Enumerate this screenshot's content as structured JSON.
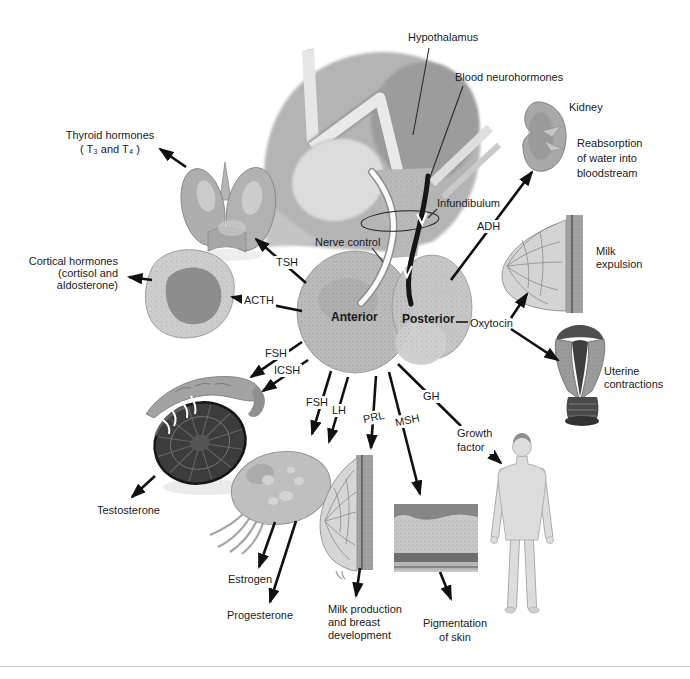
{
  "colors": {
    "background": "#ffffff",
    "ink": "#111111",
    "text": "#1a1a1a"
  },
  "brain": {
    "hypothalamus": "Hypothalamus",
    "blood_neurohormones": "Blood neurohormones",
    "infundibulum": "Infundibulum",
    "nerve_control": "Nerve control"
  },
  "pituitary": {
    "anterior": "Anterior",
    "posterior": "Posterior"
  },
  "hormones": {
    "tsh": "TSH",
    "acth": "ACTH",
    "fsh_to_testis": "FSH",
    "icsh": "ICSH",
    "fsh_to_ovary": "FSH",
    "lh": "LH",
    "prl": "PRL",
    "msh": "MSH",
    "gh": "GH",
    "adh": "ADH",
    "oxytocin": "Oxytocin",
    "growth_factor": {
      "line1": "Growth",
      "line2": "factor"
    }
  },
  "targets": {
    "kidney": {
      "name": "Kidney",
      "effect": {
        "line1": "Reabsorption",
        "line2": "of water into",
        "line3": "bloodstream"
      }
    },
    "thyroid": {
      "line1": "Thyroid hormones",
      "line2": "( T₃ and T₄ )"
    },
    "adrenal": {
      "line1": "Cortical hormones",
      "line2": "(cortisol and",
      "line3": "aldosterone)"
    },
    "breast_milk_expulsion": {
      "line1": "Milk",
      "line2": "expulsion"
    },
    "uterus": {
      "line1": "Uterine",
      "line2": "contractions"
    },
    "testis": {
      "hormone": "Testosterone"
    },
    "ovary": {
      "hormone1": "Estrogen",
      "hormone2": "Progesterone"
    },
    "breast_milk_production": {
      "line1": "Milk production",
      "line2": "and breast",
      "line3": "development"
    },
    "skin": {
      "line1": "Pigmentation",
      "line2": "of skin"
    }
  }
}
